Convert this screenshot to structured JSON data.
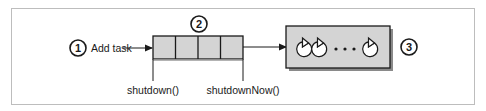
{
  "diagram": {
    "callouts": [
      {
        "id": "1",
        "label": "1"
      },
      {
        "id": "2",
        "label": "2"
      },
      {
        "id": "3",
        "label": "3"
      }
    ],
    "add_task_label": "Add task",
    "queue": {
      "cell_count": 4
    },
    "shutdown_label": "shutdown()",
    "shutdown_now_label": "shutdownNow()",
    "worker_pool": {
      "ellipsis": "• • •",
      "visible_workers": 3
    },
    "colors": {
      "box_fill": "#d4d4d4",
      "stroke": "#1a1a1a",
      "frame": "#bdbdbd",
      "shadow": "#8a8a8a"
    }
  }
}
